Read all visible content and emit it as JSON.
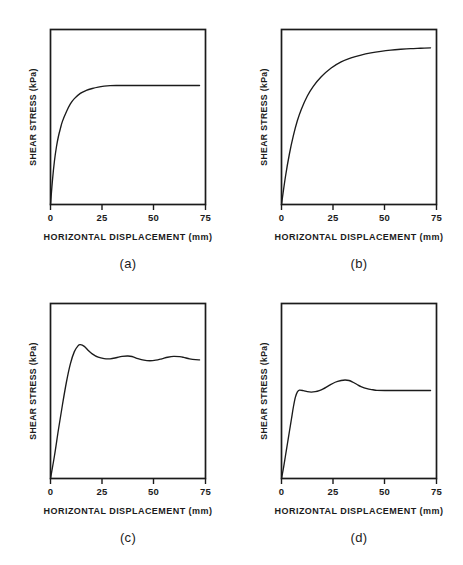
{
  "figure": {
    "background": "#ffffff",
    "ink": "#1b1b1b",
    "panel_count": 4
  },
  "chart_data": [
    {
      "type": "line",
      "panel": "a",
      "caption": "(a)",
      "title": "",
      "xlabel": "HORIZONTAL DISPLACEMENT (mm)",
      "ylabel": "SHEAR STRESS (kPa)",
      "xticks": [
        0,
        25,
        50,
        75
      ],
      "xticklabels": [
        "0",
        "25",
        "50",
        "75"
      ],
      "yticks": [],
      "yticklabels": [],
      "xlim": [
        0,
        78
      ],
      "ylim": [
        0,
        100
      ],
      "grid": false,
      "legend": null,
      "description": "Strain-hardening curve rising steeply then plateauing by ~30 mm with no peak (ductile / normally consolidated behaviour).",
      "x": [
        0,
        1,
        2,
        3,
        4,
        5,
        6,
        8,
        10,
        12,
        15,
        18,
        21,
        24,
        27,
        30,
        33,
        36,
        40,
        45,
        50,
        55,
        60,
        65,
        70,
        75
      ],
      "y": [
        0,
        14,
        25,
        33,
        39,
        43.5,
        47.5,
        53,
        57.5,
        60.5,
        63.5,
        65.2,
        66.3,
        67.1,
        67.6,
        67.9,
        68.0,
        68.0,
        68.0,
        68.0,
        68.0,
        68.0,
        68.0,
        68.0,
        68.0,
        68.0
      ]
    },
    {
      "type": "line",
      "panel": "b",
      "caption": "(b)",
      "title": "",
      "xlabel": "HORIZONTAL DISPLACEMENT (mm)",
      "ylabel": "SHEAR STRESS (kPa)",
      "xticks": [
        0,
        25,
        50,
        75
      ],
      "xticklabels": [
        "0",
        "25",
        "50",
        "75"
      ],
      "yticks": [],
      "yticklabels": [],
      "xlim": [
        0,
        78
      ],
      "ylim": [
        0,
        100
      ],
      "grid": false,
      "legend": null,
      "description": "Gradual strain-hardening curve still rising slowly at 75 mm, approaching an asymptote near the top of the plot.",
      "x": [
        0,
        2,
        4,
        6,
        8,
        10,
        13,
        16,
        20,
        25,
        30,
        35,
        40,
        45,
        50,
        55,
        60,
        65,
        70,
        75
      ],
      "y": [
        0,
        16,
        29,
        39.5,
        48,
        54.5,
        62,
        67.5,
        73,
        78,
        81.5,
        83.8,
        85.4,
        86.6,
        87.5,
        88.2,
        88.7,
        89.1,
        89.3,
        89.5
      ]
    },
    {
      "type": "line",
      "panel": "c",
      "caption": "(c)",
      "title": "",
      "xlabel": "HORIZONTAL DISPLACEMENT (mm)",
      "ylabel": "SHEAR STRESS (kPa)",
      "xticks": [
        0,
        25,
        50,
        75
      ],
      "xticklabels": [
        "0",
        "25",
        "50",
        "75"
      ],
      "yticks": [],
      "yticklabels": [],
      "xlim": [
        0,
        78
      ],
      "ylim": [
        0,
        100
      ],
      "grid": false,
      "legend": null,
      "description": "Strain-softening curve with a distinct peak near 15 mm followed by damped oscillations (stick-slip) decaying toward a residual value.",
      "x": [
        0,
        2,
        4,
        6,
        8,
        10,
        12,
        14,
        15,
        17,
        19,
        21,
        24,
        27,
        30,
        33,
        36,
        39,
        41,
        44,
        47,
        50,
        53,
        56,
        59,
        62,
        65,
        67,
        70,
        73,
        75
      ],
      "y": [
        0,
        13,
        28,
        42,
        55,
        65.5,
        72.5,
        76,
        76.5,
        75.5,
        73.2,
        71.2,
        69.3,
        68.5,
        68.4,
        69.0,
        69.8,
        70.0,
        69.7,
        68.5,
        67.6,
        67.3,
        67.6,
        68.4,
        69.3,
        69.8,
        69.6,
        69.2,
        68.4,
        67.9,
        67.8
      ]
    },
    {
      "type": "line",
      "panel": "d",
      "caption": "(d)",
      "title": "",
      "xlabel": "HORIZONTAL DISPLACEMENT (mm)",
      "ylabel": "SHEAR STRESS (kPa)",
      "xticks": [
        0,
        25,
        50,
        75
      ],
      "xticklabels": [
        "0",
        "25",
        "50",
        "75"
      ],
      "yticks": [],
      "yticklabels": [],
      "xlim": [
        0,
        78
      ],
      "ylim": [
        0,
        100
      ],
      "grid": false,
      "legend": null,
      "description": "Curve rises quickly to a first small plateau near 9 mm, dips slightly, rises to a secondary hump near 32 mm, then settles to a constant residual value after about 48 mm.",
      "x": [
        0,
        1,
        2,
        3,
        4,
        5,
        6,
        7,
        8,
        9,
        11,
        13,
        15,
        17,
        19,
        21,
        24,
        27,
        30,
        32,
        34,
        36,
        38,
        40,
        43,
        46,
        48,
        52,
        57,
        62,
        67,
        71,
        75
      ],
      "y": [
        0,
        6,
        13,
        20,
        27,
        34,
        41,
        46.5,
        49.5,
        50.5,
        50.2,
        49.6,
        49.4,
        49.6,
        50.2,
        51.2,
        53.2,
        55.0,
        56.0,
        56.3,
        56.0,
        55.0,
        53.7,
        52.5,
        51.3,
        50.7,
        50.4,
        50.3,
        50.3,
        50.3,
        50.3,
        50.3,
        50.3
      ]
    }
  ],
  "panels": [
    {
      "id": "a",
      "caption": "(a)",
      "xlabel": "HORIZONTAL DISPLACEMENT (mm)",
      "ylabel": "SHEAR STRESS (kPa)",
      "xtick0": "0",
      "xtick1": "25",
      "xtick2": "50",
      "xtick3": "75"
    },
    {
      "id": "b",
      "caption": "(b)",
      "xlabel": "HORIZONTAL DISPLACEMENT (mm)",
      "ylabel": "SHEAR STRESS (kPa)",
      "xtick0": "0",
      "xtick1": "25",
      "xtick2": "50",
      "xtick3": "75"
    },
    {
      "id": "c",
      "caption": "(c)",
      "xlabel": "HORIZONTAL DISPLACEMENT (mm)",
      "ylabel": "SHEAR STRESS (kPa)",
      "xtick0": "0",
      "xtick1": "25",
      "xtick2": "50",
      "xtick3": "75"
    },
    {
      "id": "d",
      "caption": "(d)",
      "xlabel": "HORIZONTAL DISPLACEMENT (mm)",
      "ylabel": "SHEAR STRESS (kPa)",
      "xtick0": "0",
      "xtick1": "25",
      "xtick2": "50",
      "xtick3": "75"
    }
  ]
}
